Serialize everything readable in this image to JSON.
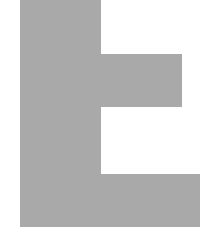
{
  "figure": {
    "fill_color": "#a9a9a9",
    "background_color": "#ffffff",
    "parts": [
      {
        "name": "vertical-bar",
        "left": 20,
        "top": 0,
        "width": 81,
        "height": 227
      },
      {
        "name": "middle-arm",
        "left": 101,
        "top": 54,
        "width": 81,
        "height": 53
      },
      {
        "name": "bottom-arm",
        "left": 101,
        "top": 174,
        "width": 99,
        "height": 53
      }
    ]
  }
}
